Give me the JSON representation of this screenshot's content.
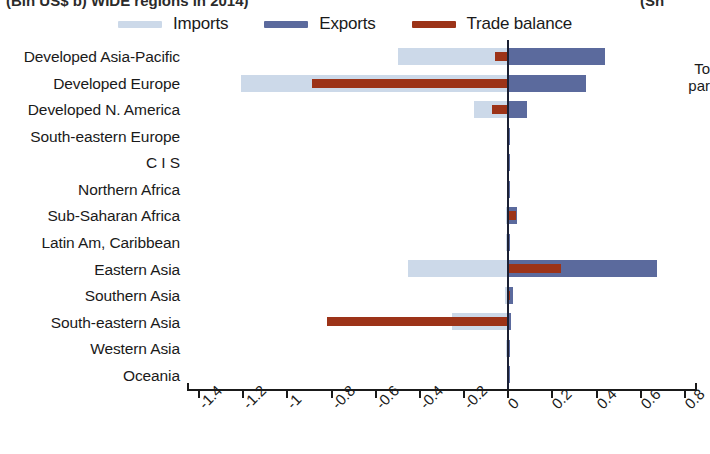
{
  "title": {
    "left_clipped": "(Bln US$ b) WIDE regions in 2014)",
    "right_clipped": "(Sh"
  },
  "legend": {
    "position": "top",
    "items": [
      {
        "label": "Imports",
        "color": "#ccd9e9",
        "name": "legend-imports"
      },
      {
        "label": "Exports",
        "color": "#5b6a9d",
        "name": "legend-exports"
      },
      {
        "label": "Trade balance",
        "color": "#9c3318",
        "name": "legend-trade-balance"
      }
    ]
  },
  "right_panel": {
    "line1": "To",
    "line2": "par"
  },
  "chart_data": {
    "type": "bar",
    "orientation": "horizontal",
    "title": "(Bln US$ b) WIDE regions in 2014)",
    "xlabel": "",
    "ylabel": "",
    "xlim": [
      -1.45,
      0.85
    ],
    "xticks": [
      -1.4,
      -1.2,
      -1,
      -0.8,
      -0.6,
      -0.4,
      -0.2,
      0,
      0.2,
      0.4,
      0.6,
      0.8
    ],
    "xtick_labels": [
      "-1.4",
      "-1.2",
      "-1",
      "-0.8",
      "-0.6",
      "-0.4",
      "-0.2",
      "0",
      "0.2",
      "0.4",
      "0.6",
      "0.8"
    ],
    "grid": false,
    "zero_line": true,
    "categories": [
      "Developed Asia-Pacific",
      "Developed Europe",
      "Developed N. America",
      "South-eastern Europe",
      "C I S",
      "Northern Africa",
      "Sub-Saharan Africa",
      "Latin Am, Caribbean",
      "Eastern Asia",
      "Southern Asia",
      "South-eastern Asia",
      "Western Asia",
      "Oceania"
    ],
    "series": [
      {
        "name": "Imports",
        "color": "#ccd9e9",
        "values": [
          -0.5,
          -1.21,
          -0.155,
          -0.005,
          -0.004,
          -0.004,
          -0.012,
          -0.008,
          -0.455,
          -0.016,
          -0.255,
          -0.01,
          -0.004
        ]
      },
      {
        "name": "Exports",
        "color": "#5b6a9d",
        "values": [
          0.44,
          0.35,
          0.085,
          0.004,
          0.003,
          0.003,
          0.04,
          0.006,
          0.675,
          0.02,
          0.012,
          0.008,
          0.004
        ]
      },
      {
        "name": "Trade balance",
        "color": "#9c3318",
        "values": [
          -0.06,
          -0.89,
          -0.075,
          -0.004,
          -0.003,
          -0.003,
          0.033,
          -0.006,
          0.24,
          0.01,
          -0.82,
          -0.006,
          -0.003
        ]
      }
    ]
  }
}
